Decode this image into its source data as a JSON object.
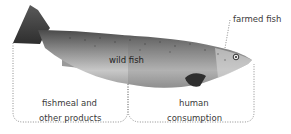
{
  "diagram": {
    "labels": {
      "farmed_fish": "farmed fish",
      "wild_fish": "wild fish",
      "left_bracket_line1": "fishmeal and",
      "left_bracket_line2": "other products",
      "right_bracket_line1": "human",
      "right_bracket_line2": "consumption"
    },
    "regions": [
      {
        "name": "fishmeal and other products",
        "side": "left (tail half)"
      },
      {
        "name": "human consumption",
        "side": "right (head half)"
      }
    ],
    "colors": {
      "fish_dark": "#3c3c3c",
      "fish_mid": "#8a8a8a",
      "fish_light": "#d6d6d6",
      "bracket": "#8c8c8c",
      "text": "#3a3a3a"
    }
  }
}
